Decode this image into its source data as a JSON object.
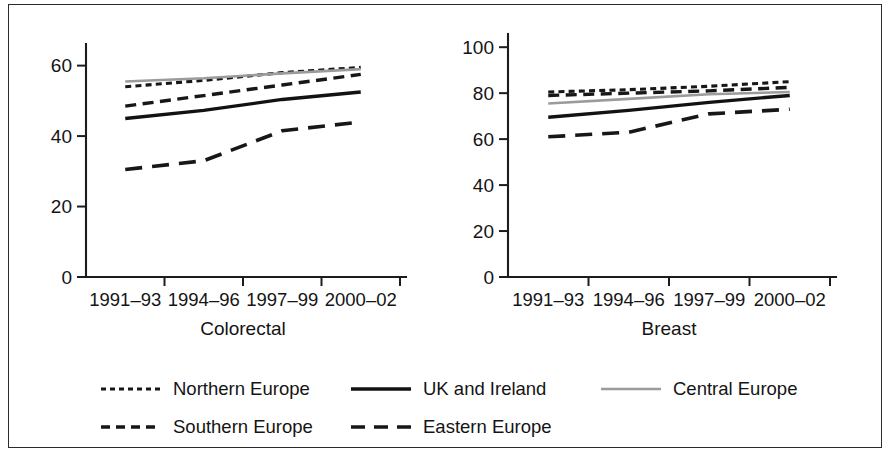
{
  "figure": {
    "background": "#ffffff",
    "frame_color": "#2b2b2b"
  },
  "legend": {
    "position": "bottom",
    "items": [
      {
        "label": "Northern Europe",
        "style": "dotted",
        "color": "#171717",
        "row": 1,
        "col": 1
      },
      {
        "label": "UK and Ireland",
        "style": "solid",
        "color": "#121212",
        "row": 1,
        "col": 2
      },
      {
        "label": "Central Europe",
        "style": "solid-gray",
        "color": "#9b9b9b",
        "row": 1,
        "col": 3
      },
      {
        "label": "Southern Europe",
        "style": "dashed",
        "color": "#171717",
        "row": 2,
        "col": 1
      },
      {
        "label": "Eastern Europe",
        "style": "long-dash",
        "color": "#171717",
        "row": 2,
        "col": 2
      }
    ]
  },
  "chart_data": [
    {
      "type": "line",
      "title": "Colorectal",
      "xlabel": "",
      "ylabel": "",
      "categories": [
        "1991–93",
        "1994–96",
        "1997–99",
        "2000–02"
      ],
      "yticks": [
        0,
        20,
        40,
        60
      ],
      "ylim": [
        0,
        65
      ],
      "grid": false,
      "legend_position": "bottom",
      "series": [
        {
          "name": "Northern Europe",
          "style": "dotted",
          "color": "#171717",
          "values": [
            54.0,
            55.8,
            58.0,
            59.5
          ]
        },
        {
          "name": "Central Europe",
          "style": "solid-gray",
          "color": "#9b9b9b",
          "values": [
            55.5,
            56.4,
            57.8,
            59.0
          ]
        },
        {
          "name": "Southern Europe",
          "style": "dashed",
          "color": "#171717",
          "values": [
            48.5,
            51.5,
            54.5,
            57.5
          ]
        },
        {
          "name": "UK and Ireland",
          "style": "solid",
          "color": "#121212",
          "values": [
            45.0,
            47.3,
            50.4,
            52.5
          ]
        },
        {
          "name": "Eastern Europe",
          "style": "long-dash",
          "color": "#171717",
          "values": [
            30.5,
            33.0,
            41.5,
            44.0
          ]
        }
      ]
    },
    {
      "type": "line",
      "title": "Breast",
      "xlabel": "",
      "ylabel": "",
      "categories": [
        "1991–93",
        "1994–96",
        "1997–99",
        "2000–02"
      ],
      "yticks": [
        0,
        20,
        40,
        60,
        80,
        100
      ],
      "ylim": [
        0,
        104
      ],
      "grid": false,
      "legend_position": "bottom",
      "series": [
        {
          "name": "Northern Europe",
          "style": "dotted",
          "color": "#171717",
          "values": [
            80.5,
            81.5,
            83.0,
            85.0
          ]
        },
        {
          "name": "Southern Europe",
          "style": "dashed",
          "color": "#171717",
          "values": [
            79.0,
            80.0,
            81.0,
            82.5
          ]
        },
        {
          "name": "Central Europe",
          "style": "solid-gray",
          "color": "#9b9b9b",
          "values": [
            75.5,
            77.5,
            79.5,
            80.5
          ]
        },
        {
          "name": "UK and Ireland",
          "style": "solid",
          "color": "#121212",
          "values": [
            69.5,
            72.5,
            76.0,
            79.0
          ]
        },
        {
          "name": "Eastern Europe",
          "style": "long-dash",
          "color": "#171717",
          "values": [
            61.0,
            63.0,
            71.0,
            73.0
          ]
        }
      ]
    }
  ]
}
